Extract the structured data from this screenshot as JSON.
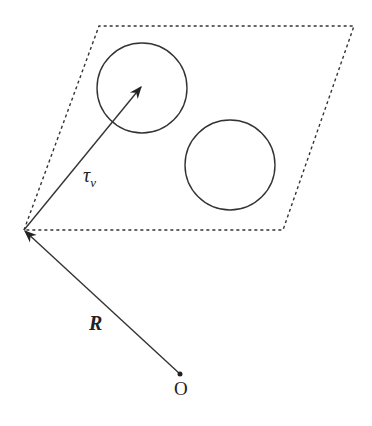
{
  "diagram": {
    "labels": {
      "tau_main": "τ",
      "tau_sub": "ν",
      "R": "R",
      "origin": "O"
    },
    "colors": {
      "stroke": "#333333",
      "background": "#ffffff"
    },
    "shapes": {
      "parallelogram": {
        "points": [
          [
            24,
            230
          ],
          [
            99,
            26
          ],
          [
            354,
            26
          ],
          [
            283,
            230
          ]
        ],
        "style": "dotted"
      },
      "circles": [
        {
          "cx": 142,
          "cy": 88,
          "r": 45
        },
        {
          "cx": 230,
          "cy": 165,
          "r": 45
        }
      ],
      "vectors": [
        {
          "name": "tau_nu",
          "from": [
            24,
            230
          ],
          "to": [
            142,
            86
          ]
        },
        {
          "name": "R",
          "from": [
            180,
            374
          ],
          "to": [
            24,
            230
          ]
        }
      ],
      "origin_point": [
        180,
        374
      ]
    }
  }
}
